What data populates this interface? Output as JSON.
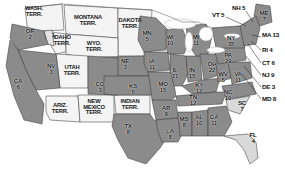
{
  "map": {
    "title": "United States electoral map",
    "colors": {
      "background": "#ffffff",
      "state_dark": "#8b8b8b",
      "state_light": "#d9d9d9",
      "territory": "#f2f2f2",
      "lake": "#ffffff",
      "border": "#3a3a3a",
      "text": "#111111"
    },
    "states": [
      {
        "ab": "OR",
        "ev": "2",
        "shade": "dark",
        "x": 30,
        "y": 33
      },
      {
        "ab": "",
        "ev": "1",
        "shade": "light",
        "x": 53,
        "y": 37
      },
      {
        "ab": "CA",
        "ev": "6",
        "shade": "dark",
        "x": 18,
        "y": 83
      },
      {
        "ab": "NV",
        "ev": "3",
        "shade": "dark",
        "x": 51,
        "y": 68
      },
      {
        "ab": "NE",
        "ev": "3",
        "shade": "dark",
        "x": 125,
        "y": 63
      },
      {
        "ab": "CO",
        "ev": "3",
        "shade": "dark",
        "x": 100,
        "y": 86
      },
      {
        "ab": "KS",
        "ev": "5",
        "shade": "dark",
        "x": 133,
        "y": 88
      },
      {
        "ab": "TX",
        "ev": "8",
        "shade": "dark",
        "x": 128,
        "y": 128
      },
      {
        "ab": "MN",
        "ev": "5",
        "shade": "dark",
        "x": 147,
        "y": 35
      },
      {
        "ab": "IA",
        "ev": "11",
        "shade": "dark",
        "x": 152,
        "y": 63
      },
      {
        "ab": "MO",
        "ev": "15",
        "shade": "dark",
        "x": 163,
        "y": 86
      },
      {
        "ab": "AR",
        "ev": "8",
        "shade": "dark",
        "x": 166,
        "y": 110
      },
      {
        "ab": "LA",
        "ev": "8",
        "shade": "dark",
        "x": 170,
        "y": 133
      },
      {
        "ab": "WI",
        "ev": "10",
        "shade": "dark",
        "x": 170,
        "y": 39
      },
      {
        "ab": "IL",
        "ev": "21",
        "shade": "dark",
        "x": 175,
        "y": 72
      },
      {
        "ab": "MS",
        "ev": "8",
        "shade": "dark",
        "x": 184,
        "y": 121
      },
      {
        "ab": "IN",
        "ev": "15",
        "shade": "dark",
        "x": 192,
        "y": 72
      },
      {
        "ab": "MI",
        "ev": "11",
        "shade": "dark",
        "x": 196,
        "y": 39
      },
      {
        "ab": "AL",
        "ev": "10",
        "shade": "dark",
        "x": 199,
        "y": 119
      },
      {
        "ab": "OH",
        "ev": "22",
        "shade": "dark",
        "x": 212,
        "y": 66
      },
      {
        "ab": "KY",
        "ev": "12",
        "shade": "dark",
        "x": 199,
        "y": 87
      },
      {
        "ab": "TN",
        "ev": "12",
        "shade": "dark",
        "x": 193,
        "y": 99
      },
      {
        "ab": "GA",
        "ev": "11",
        "shade": "dark",
        "x": 214,
        "y": 119
      },
      {
        "ab": "WV",
        "ev": "5",
        "shade": "dark",
        "x": 223,
        "y": 76
      },
      {
        "ab": "VA",
        "ev": "11",
        "shade": "dark",
        "x": 238,
        "y": 76
      },
      {
        "ab": "NC",
        "ev": "10",
        "shade": "dark",
        "x": 228,
        "y": 94
      },
      {
        "ab": "SC",
        "ev": "7",
        "shade": "light",
        "x": 242,
        "y": 105
      },
      {
        "ab": "FL",
        "ev": "4",
        "shade": "light",
        "x": 253,
        "y": 137
      },
      {
        "ab": "PA",
        "ev": "29",
        "shade": "dark",
        "x": 228,
        "y": 57
      },
      {
        "ab": "NY",
        "ev": "35",
        "shade": "dark",
        "x": 231,
        "y": 40
      },
      {
        "ab": "ME",
        "ev": "7",
        "shade": "dark",
        "x": 264,
        "y": 15
      }
    ],
    "callout_states": [
      {
        "ab": "NH",
        "ev": "5",
        "x": 232,
        "y": 5,
        "side": "left"
      },
      {
        "ab": "VT",
        "ev": "5",
        "x": 212,
        "y": 12,
        "side": "left"
      },
      {
        "ab": "MA",
        "ev": "13",
        "x": 262,
        "y": 32,
        "side": "right"
      },
      {
        "ab": "RI",
        "ev": "4",
        "x": 262,
        "y": 47,
        "side": "right"
      },
      {
        "ab": "CT",
        "ev": "6",
        "x": 262,
        "y": 60,
        "side": "right"
      },
      {
        "ab": "NJ",
        "ev": "9",
        "x": 262,
        "y": 72,
        "side": "right"
      },
      {
        "ab": "DE",
        "ev": "3",
        "x": 262,
        "y": 84,
        "side": "right"
      },
      {
        "ab": "MD",
        "ev": "8",
        "x": 262,
        "y": 96,
        "side": "right"
      }
    ],
    "territories": [
      {
        "lines": [
          "WASH.",
          "TERR."
        ],
        "x": 34,
        "y": 10
      },
      {
        "lines": [
          "MONTANA",
          "TERR."
        ],
        "x": 88,
        "y": 19
      },
      {
        "lines": [
          "DAKOTA",
          "TERR."
        ],
        "x": 130,
        "y": 22
      },
      {
        "lines": [
          "IDAHO",
          "TERR."
        ],
        "x": 62,
        "y": 39
      },
      {
        "lines": [
          "WYO.",
          "TERR."
        ],
        "x": 94,
        "y": 45
      },
      {
        "lines": [
          "UTAH",
          "TERR."
        ],
        "x": 72,
        "y": 69
      },
      {
        "lines": [
          "ARIZ.",
          "TERR."
        ],
        "x": 60,
        "y": 107
      },
      {
        "lines": [
          "NEW",
          "MEXICO",
          "TERR."
        ],
        "x": 94,
        "y": 103
      },
      {
        "lines": [
          "INDIAN",
          "TERR."
        ],
        "x": 130,
        "y": 103
      }
    ]
  }
}
